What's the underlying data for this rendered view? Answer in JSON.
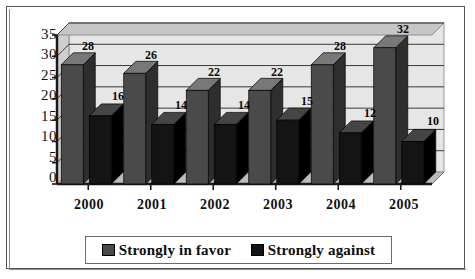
{
  "chart_data": {
    "type": "bar",
    "title": "",
    "xlabel": "",
    "ylabel": "",
    "categories": [
      "2000",
      "2001",
      "2002",
      "2003",
      "2004",
      "2005"
    ],
    "series": [
      {
        "name": "Strongly in favor",
        "values": [
          28,
          26,
          22,
          22,
          28,
          32
        ],
        "color": "#4a4a4a"
      },
      {
        "name": "Strongly against",
        "values": [
          16,
          14,
          14,
          15,
          12,
          10
        ],
        "color": "#141414"
      }
    ],
    "ylim": [
      0,
      35
    ],
    "yticks": [
      0,
      5,
      10,
      15,
      20,
      25,
      30,
      35
    ],
    "ytick_labels": [
      "0",
      "5",
      "10",
      "15",
      "20",
      "25",
      "30",
      "35"
    ],
    "grid": true,
    "legend_position": "bottom",
    "style": "3d-column",
    "data_labels": true
  },
  "legend": {
    "entries": [
      {
        "label": "Strongly in favor",
        "swatch": "#4a4a4a"
      },
      {
        "label": "Strongly against",
        "swatch": "#141414"
      }
    ]
  },
  "colors": {
    "wall": "#cfcfcf",
    "wall_band": "#e6e6e6",
    "floor": "#bdbdbd",
    "gridline": "#3a3a3a",
    "axis": "#1a1a1a",
    "bar_favor_front": "#4a4a4a",
    "bar_favor_top": "#787878",
    "bar_favor_side": "#2e2e2e",
    "bar_against_front": "#141414",
    "bar_against_top": "#454545",
    "bar_against_side": "#000000",
    "frame": "#555555",
    "page_background": "#ffffff"
  }
}
